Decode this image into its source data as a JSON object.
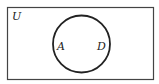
{
  "diagram": {
    "type": "venn",
    "universe_label": "U",
    "circle_labels": [
      "A",
      "D"
    ],
    "stroke_color": "#333333",
    "background": "#ffffff"
  }
}
